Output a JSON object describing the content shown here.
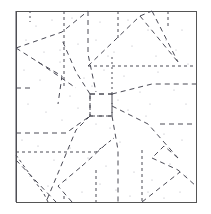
{
  "figure": {
    "type": "crease-pattern",
    "caption": "",
    "canvas": {
      "width": 211,
      "height": 214
    },
    "background_color": "#ffffff"
  },
  "sheet": {
    "name": "square-sheet",
    "x": 16,
    "y": 11,
    "width": 180,
    "height": 191,
    "border_color": "#555555",
    "border_width": 1,
    "fill": "#ffffff"
  },
  "styles": {
    "crease_color": "#4a4a55",
    "crease_width": 1,
    "dash_long": "5 4",
    "dash_short": "3 3",
    "dash_fine": "2 3",
    "speckle_color": "#9a9aa5"
  },
  "center_square": {
    "name": "central-square",
    "x": 90,
    "y": 94,
    "size": 22,
    "note": "small square hub where creases converge"
  },
  "creases": [
    {
      "id": "c01",
      "group": "top-left-diagonal",
      "points": "16,48 62,32 88,11",
      "dash": "5 4"
    },
    {
      "id": "c02",
      "group": "top-left-fan",
      "points": "16,48 38,62 76,88",
      "dash": "5 4"
    },
    {
      "id": "c03",
      "group": "top-left-fan",
      "points": "38,62 62,76 58,104",
      "dash": "5 4"
    },
    {
      "id": "c04",
      "group": "vertical-top-1",
      "points": "64,11 64,86",
      "dash": "3 3"
    },
    {
      "id": "c05",
      "group": "vertical-top-2",
      "points": "88,11 88,54 96,92",
      "dash": "5 4"
    },
    {
      "id": "c06",
      "group": "vertical-top-3",
      "points": "118,11 118,40",
      "dash": "3 3"
    },
    {
      "id": "c07",
      "group": "upper-right-triangle",
      "points": "88,66 140,16 178,62",
      "dash": "5 4"
    },
    {
      "id": "c08",
      "group": "upper-right-triangle",
      "points": "140,16 152,11",
      "dash": "5 4"
    },
    {
      "id": "c09",
      "group": "upper-right-apex",
      "points": "152,11 178,62",
      "dash": "5 4"
    },
    {
      "id": "c10",
      "group": "right-horizontal-1",
      "points": "88,66 196,66",
      "dash": "3 3"
    },
    {
      "id": "c11",
      "group": "right-horizontal-2",
      "points": "112,94 152,84 196,84",
      "dash": "5 4"
    },
    {
      "id": "c12",
      "group": "left-short-tick",
      "points": "16,88 34,88",
      "dash": "5 4"
    },
    {
      "id": "c13",
      "group": "left-horizontal-upper",
      "points": "16,133 66,133 90,116",
      "dash": "5 4"
    },
    {
      "id": "c14",
      "group": "left-horizontal-lower",
      "points": "16,152 96,152 114,138",
      "dash": "3 3"
    },
    {
      "id": "c15",
      "group": "hub-down-left",
      "points": "90,116 76,130 46,202",
      "dash": "5 4"
    },
    {
      "id": "c16",
      "group": "hub-down-right",
      "points": "112,116 118,150 118,202",
      "dash": "5 4"
    },
    {
      "id": "c17",
      "group": "hub-up-left",
      "points": "90,94 76,72 62,40",
      "dash": "5 4"
    },
    {
      "id": "c18",
      "group": "hub-right-diag",
      "points": "112,106 148,124 178,158",
      "dash": "5 4"
    },
    {
      "id": "c19",
      "group": "right-horizontal-3",
      "points": "160,124 196,124",
      "dash": "5 4"
    },
    {
      "id": "c20",
      "group": "right-lower-zigzag",
      "points": "178,158 164,146 152,158",
      "dash": "5 4"
    },
    {
      "id": "c21",
      "group": "right-lower-zigzag",
      "points": "152,158 178,170 196,186",
      "dash": "5 4"
    },
    {
      "id": "c22",
      "group": "right-lower-diag",
      "points": "142,202 180,172",
      "dash": "5 4"
    },
    {
      "id": "c23",
      "group": "bottom-right-vert",
      "points": "142,150 142,202",
      "dash": "3 3"
    },
    {
      "id": "c24",
      "group": "bottom-mid-vert",
      "points": "96,170 96,202",
      "dash": "3 3"
    },
    {
      "id": "c25",
      "group": "bottom-left-diag-1",
      "points": "16,160 56,202",
      "dash": "5 4"
    },
    {
      "id": "c26",
      "group": "bottom-left-diag-2",
      "points": "16,155 44,194 48,202",
      "dash": "3 3"
    },
    {
      "id": "c27",
      "group": "bottom-left-valley",
      "points": "72,202 58,186 82,166",
      "dash": "5 4"
    },
    {
      "id": "c28",
      "group": "bottom-left-valley",
      "points": "82,166 104,146",
      "dash": "5 4"
    },
    {
      "id": "c29",
      "group": "left-upper-vert",
      "points": "16,11 16,202",
      "dash": "none"
    },
    {
      "id": "c30",
      "group": "mid-right-vert",
      "points": "196,94 196,94",
      "dash": "none"
    },
    {
      "id": "c31",
      "group": "hub-left-edge",
      "points": "90,94 90,116",
      "dash": "5 4"
    },
    {
      "id": "c32",
      "group": "hub-top-edge",
      "points": "90,94 112,94",
      "dash": "5 4"
    },
    {
      "id": "c33",
      "group": "hub-right-edge",
      "points": "112,94 112,116",
      "dash": "5 4"
    },
    {
      "id": "c34",
      "group": "hub-bottom-edge",
      "points": "90,116 112,116",
      "dash": "5 4"
    },
    {
      "id": "c35",
      "group": "upper-mid-vert-b",
      "points": "112,94 112,56",
      "dash": "2 3"
    },
    {
      "id": "c36",
      "group": "top-right-vert",
      "points": "168,11 168,28",
      "dash": "3 3"
    },
    {
      "id": "c37",
      "group": "bottom-edge-tick-1",
      "points": "64,196 64,202",
      "dash": "3 3"
    },
    {
      "id": "c38",
      "group": "upper-left-vert-tick",
      "points": "30,11 30,22",
      "dash": "2 3"
    }
  ],
  "speckles": [
    {
      "x": 36,
      "y": 26
    },
    {
      "x": 52,
      "y": 20
    },
    {
      "x": 72,
      "y": 18
    },
    {
      "x": 100,
      "y": 22
    },
    {
      "x": 128,
      "y": 20
    },
    {
      "x": 148,
      "y": 30
    },
    {
      "x": 166,
      "y": 40
    },
    {
      "x": 182,
      "y": 30
    },
    {
      "x": 26,
      "y": 40
    },
    {
      "x": 44,
      "y": 52
    },
    {
      "x": 60,
      "y": 50
    },
    {
      "x": 78,
      "y": 44
    },
    {
      "x": 96,
      "y": 40
    },
    {
      "x": 114,
      "y": 52
    },
    {
      "x": 132,
      "y": 46
    },
    {
      "x": 156,
      "y": 56
    },
    {
      "x": 176,
      "y": 50
    },
    {
      "x": 188,
      "y": 64
    },
    {
      "x": 24,
      "y": 70
    },
    {
      "x": 40,
      "y": 80
    },
    {
      "x": 56,
      "y": 74
    },
    {
      "x": 70,
      "y": 96
    },
    {
      "x": 84,
      "y": 78
    },
    {
      "x": 104,
      "y": 70
    },
    {
      "x": 124,
      "y": 76
    },
    {
      "x": 140,
      "y": 92
    },
    {
      "x": 158,
      "y": 72
    },
    {
      "x": 174,
      "y": 90
    },
    {
      "x": 186,
      "y": 104
    },
    {
      "x": 28,
      "y": 104
    },
    {
      "x": 46,
      "y": 112
    },
    {
      "x": 62,
      "y": 120
    },
    {
      "x": 78,
      "y": 108
    },
    {
      "x": 96,
      "y": 124
    },
    {
      "x": 110,
      "y": 128
    },
    {
      "x": 128,
      "y": 110
    },
    {
      "x": 146,
      "y": 116
    },
    {
      "x": 164,
      "y": 134
    },
    {
      "x": 182,
      "y": 140
    },
    {
      "x": 22,
      "y": 140
    },
    {
      "x": 38,
      "y": 146
    },
    {
      "x": 54,
      "y": 160
    },
    {
      "x": 70,
      "y": 148
    },
    {
      "x": 88,
      "y": 158
    },
    {
      "x": 106,
      "y": 166
    },
    {
      "x": 120,
      "y": 142
    },
    {
      "x": 134,
      "y": 172
    },
    {
      "x": 152,
      "y": 180
    },
    {
      "x": 170,
      "y": 164
    },
    {
      "x": 186,
      "y": 176
    },
    {
      "x": 30,
      "y": 176
    },
    {
      "x": 48,
      "y": 186
    },
    {
      "x": 66,
      "y": 180
    },
    {
      "x": 82,
      "y": 192
    },
    {
      "x": 100,
      "y": 184
    },
    {
      "x": 116,
      "y": 190
    },
    {
      "x": 130,
      "y": 196
    },
    {
      "x": 148,
      "y": 192
    },
    {
      "x": 164,
      "y": 198
    },
    {
      "x": 180,
      "y": 192
    },
    {
      "x": 60,
      "y": 62
    },
    {
      "x": 92,
      "y": 86
    },
    {
      "x": 118,
      "y": 100
    },
    {
      "x": 108,
      "y": 56
    },
    {
      "x": 150,
      "y": 104
    }
  ]
}
